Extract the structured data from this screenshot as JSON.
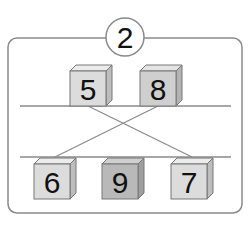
{
  "puzzle": {
    "badge_number": "2",
    "top_row": [
      {
        "label": "5",
        "shade": "#dcdcdc"
      },
      {
        "label": "8",
        "shade": "#cfcfcf"
      }
    ],
    "bottom_row": [
      {
        "label": "6",
        "shade": "#dcdcdc"
      },
      {
        "label": "9",
        "shade": "#b9b9b9"
      },
      {
        "label": "7",
        "shade": "#dcdcdc"
      }
    ],
    "connections": [
      {
        "from": "5",
        "to": "7"
      },
      {
        "from": "8",
        "to": "6"
      }
    ],
    "colors": {
      "frame": "#8a8a8a",
      "line": "#8a8a8a",
      "cube_edge": "#777777"
    }
  }
}
